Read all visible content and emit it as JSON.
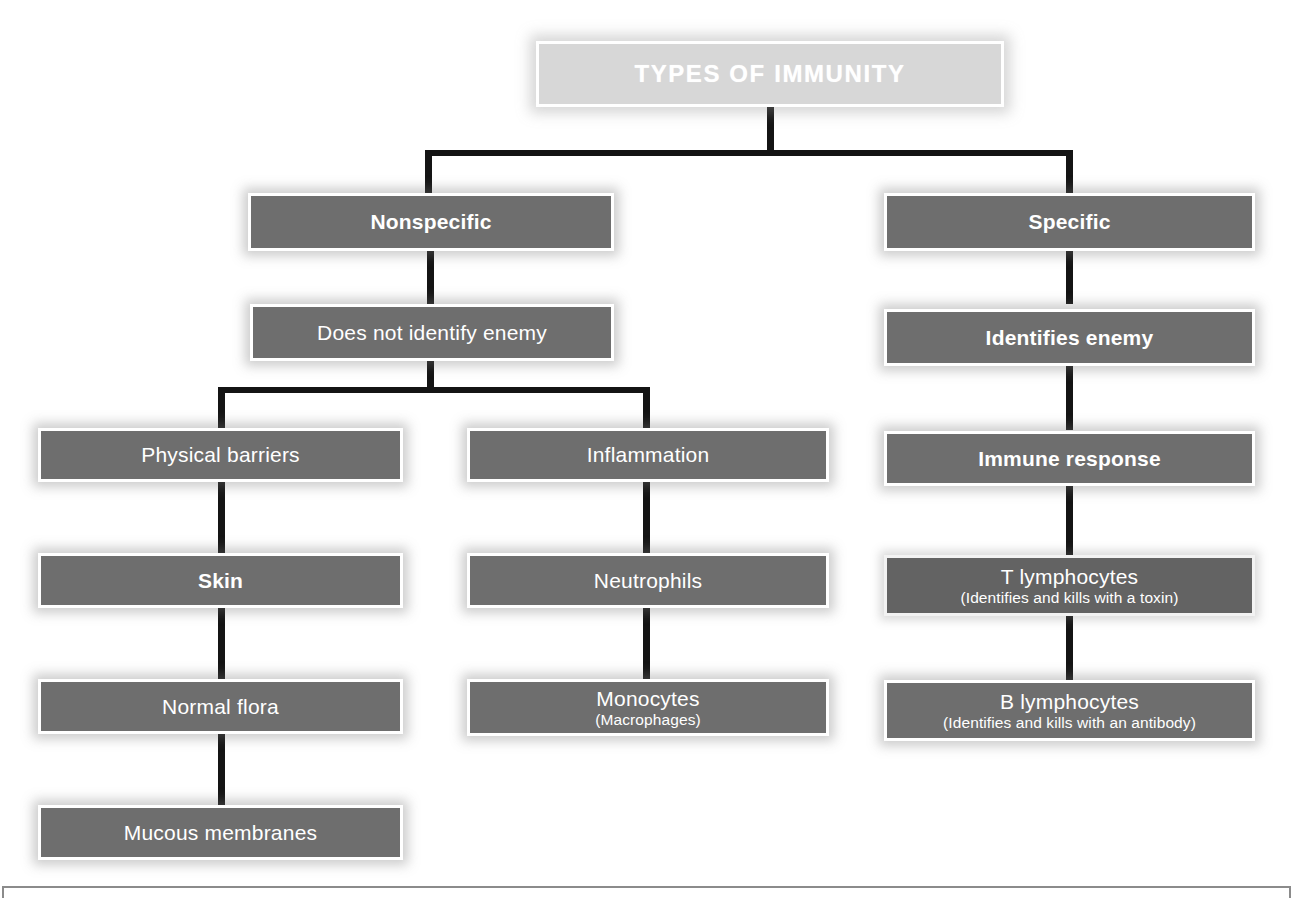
{
  "diagram": {
    "title": "TYPES OF IMMUNITY",
    "colors": {
      "node_fill": "#6e6e6e",
      "node_fill_dark": "#636363",
      "title_fill": "#d7d7d7",
      "node_border": "#ffffff",
      "node_text": "#ffffff",
      "connector": "#141414",
      "page_frame": "#8b8b8b"
    },
    "root": {
      "label": "TYPES OF IMMUNITY"
    },
    "branches": [
      {
        "name": "nonspecific",
        "heading": "Nonspecific",
        "definition": "Does not identify enemy",
        "children": [
          {
            "label": "Physical barriers",
            "chain": [
              "Skin",
              "Normal flora",
              "Mucous membranes"
            ]
          },
          {
            "label": "Inflammation",
            "chain": [
              "Neutrophils",
              "Monocytes"
            ]
          }
        ]
      },
      {
        "name": "specific",
        "heading": "Specific",
        "definition": "Identifies enemy",
        "children": [
          {
            "label": "Immune response",
            "chain": [
              "T lymphocytes",
              "B lymphocytes"
            ]
          }
        ]
      }
    ],
    "nodes": {
      "nonspecific": "Nonspecific",
      "does_not_identify_enemy": "Does not identify enemy",
      "physical_barriers": "Physical barriers",
      "inflammation": "Inflammation",
      "skin": "Skin",
      "neutrophils": "Neutrophils",
      "normal_flora": "Normal flora",
      "monocytes_main": "Monocytes",
      "monocytes_sub": "(Macrophages)",
      "mucous_membranes": "Mucous membranes",
      "specific": "Specific",
      "identifies_enemy": "Identifies enemy",
      "immune_response": "Immune response",
      "t_lymphocytes_main": "T lymphocytes",
      "t_lymphocytes_sub": "(Identifies and kills with a toxin)",
      "b_lymphocytes_main": "B lymphocytes",
      "b_lymphocytes_sub": "(Identifies and kills with an antibody)"
    }
  }
}
